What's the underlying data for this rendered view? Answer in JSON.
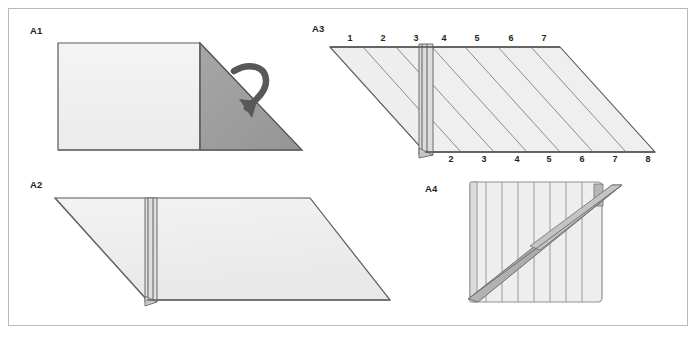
{
  "figure": {
    "panel_count": 4,
    "border_color": "#b9b9b9",
    "background_color": "#ffffff"
  },
  "colors": {
    "paper_light": "#f0f0f0",
    "paper_light2": "#e9e9e9",
    "paper_shadow": "#9a9a9a",
    "paper_dark": "#a0a0a0",
    "outline": "#58585a",
    "outline_dark": "#404041",
    "crease": "#8c8c8c",
    "arrow": "#58585a",
    "label_text": "#231f20"
  },
  "panels": [
    {
      "id": "A1",
      "label": "A1",
      "label_x": 30,
      "label_y": 32,
      "description": "Rectangle with dark triangular flap on right and a curved fold-over arrow",
      "has_arrow": true,
      "arrow_name": "fold-over-arrow"
    },
    {
      "id": "A2",
      "label": "A2",
      "label_x": 30,
      "label_y": 186,
      "description": "Parallelogram sheet with a vertical pleat band near the left third",
      "has_arrow": false
    },
    {
      "id": "A3",
      "label": "A3",
      "label_x": 312,
      "label_y": 30,
      "description": "Parallelogram with diagonal crease lines, vertical pleat band, numbered creases top and bottom",
      "has_arrow": false
    },
    {
      "id": "A4",
      "label": "A4",
      "label_x": 425,
      "label_y": 190,
      "description": "Pleated square with vertical accordion folds crossed by a diagonal strip",
      "has_arrow": false
    }
  ],
  "a3_labels": {
    "top_row": [
      {
        "text": "1",
        "x": 350,
        "y": 40
      },
      {
        "text": "2",
        "x": 383,
        "y": 40
      },
      {
        "text": "3",
        "x": 416,
        "y": 40
      },
      {
        "text": "4",
        "x": 444,
        "y": 40
      },
      {
        "text": "5",
        "x": 477,
        "y": 40
      },
      {
        "text": "6",
        "x": 511,
        "y": 40
      },
      {
        "text": "7",
        "x": 544,
        "y": 40
      }
    ],
    "bottom_row": [
      {
        "text": "2",
        "x": 451,
        "y": 160
      },
      {
        "text": "3",
        "x": 484,
        "y": 160
      },
      {
        "text": "4",
        "x": 517,
        "y": 160
      },
      {
        "text": "5",
        "x": 549,
        "y": 160
      },
      {
        "text": "6",
        "x": 582,
        "y": 160
      },
      {
        "text": "7",
        "x": 615,
        "y": 160
      },
      {
        "text": "8",
        "x": 648,
        "y": 160
      }
    ]
  },
  "a4_pleats": {
    "count": 8,
    "x_positions": [
      479,
      495,
      511,
      527,
      543,
      559,
      575,
      591
    ]
  }
}
